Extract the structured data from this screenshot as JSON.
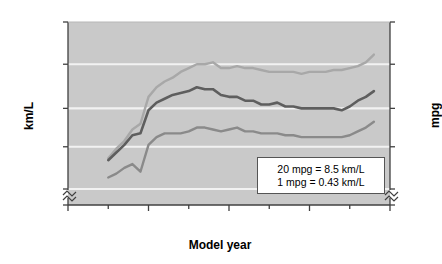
{
  "chart_data": {
    "type": "line",
    "title": "",
    "xlabel": "Model year",
    "ylabel": "km/L",
    "ylabel_right": "mpg",
    "xlim": [
      1970,
      2010
    ],
    "ylim": [
      0,
      13.0
    ],
    "ylim_right": [
      0,
      30
    ],
    "grid": true,
    "grid_orientation": "horizontal",
    "legend_position": "inline-annotations",
    "axis_break_left": true,
    "axis_break_right": true,
    "axis_break_bottom": true,
    "y_ticks_left": [
      "0",
      "4.3",
      "6.5",
      "8.5",
      "10.8",
      "13.0"
    ],
    "y_tick_values_left": [
      0,
      4.3,
      6.5,
      8.5,
      10.8,
      13.0
    ],
    "y_ticks_right": [
      "0",
      "10",
      "15",
      "20",
      "25",
      "30"
    ],
    "y_tick_values_right": [
      0,
      10,
      15,
      20,
      25,
      30
    ],
    "x_ticks": [
      "1970",
      "1980",
      "1990",
      "2000",
      "2010"
    ],
    "x_tick_values": [
      1970,
      1980,
      1990,
      2000,
      2010
    ],
    "x_minor_ticks": [
      1975,
      1985,
      1995,
      2005
    ],
    "x": [
      1975,
      1976,
      1977,
      1978,
      1979,
      1980,
      1981,
      1982,
      1983,
      1984,
      1985,
      1986,
      1987,
      1988,
      1989,
      1990,
      1991,
      1992,
      1993,
      1994,
      1995,
      1996,
      1997,
      1998,
      1999,
      2000,
      2001,
      2002,
      2003,
      2004,
      2005,
      2006,
      2007,
      2008
    ],
    "series": [
      {
        "name": "Cars",
        "color": "#a8a8a8",
        "values": [
          5.9,
          6.4,
          6.8,
          7.4,
          7.7,
          9.1,
          9.6,
          9.9,
          10.1,
          10.4,
          10.6,
          10.8,
          10.8,
          10.9,
          10.6,
          10.6,
          10.7,
          10.6,
          10.6,
          10.5,
          10.4,
          10.4,
          10.4,
          10.4,
          10.3,
          10.4,
          10.4,
          10.4,
          10.5,
          10.5,
          10.6,
          10.7,
          10.9,
          11.3
        ],
        "units": "km/L"
      },
      {
        "name": "Both",
        "color": "#5e5e5e",
        "values": [
          5.8,
          6.2,
          6.6,
          7.1,
          7.2,
          8.4,
          8.8,
          9.0,
          9.2,
          9.3,
          9.4,
          9.6,
          9.5,
          9.5,
          9.2,
          9.1,
          9.1,
          8.9,
          8.9,
          8.7,
          8.7,
          8.8,
          8.6,
          8.6,
          8.5,
          8.5,
          8.5,
          8.5,
          8.5,
          8.4,
          8.6,
          8.9,
          9.1,
          9.4
        ],
        "units": "km/L"
      },
      {
        "name": "Light trucks",
        "color": "#8a8a8a",
        "values": [
          4.9,
          5.1,
          5.4,
          5.6,
          5.2,
          6.6,
          7.0,
          7.2,
          7.2,
          7.2,
          7.3,
          7.5,
          7.5,
          7.4,
          7.3,
          7.4,
          7.5,
          7.3,
          7.3,
          7.2,
          7.2,
          7.2,
          7.1,
          7.1,
          7.0,
          7.0,
          7.0,
          7.0,
          7.0,
          7.0,
          7.1,
          7.3,
          7.5,
          7.8
        ],
        "units": "km/L"
      }
    ],
    "annotations": [
      {
        "name": "cars-label",
        "text": "Cars",
        "x": 1986,
        "y": 11.4
      },
      {
        "name": "both-label",
        "text": "Both",
        "x": 1999,
        "y": 9.3
      },
      {
        "name": "light-trucks-label",
        "text": "Light trucks",
        "x": 1988,
        "y": 6.6
      }
    ],
    "note_box": {
      "lines": [
        "20 mpg = 8.5 km/L",
        "1 mpg = 0.43 km/L"
      ]
    }
  },
  "colors": {
    "plot_background": "#c9c9c9",
    "page_background": "#ffffff",
    "gridline": "#f2f2f2",
    "axis": "#404040",
    "text": "#000000",
    "cars": "#a8a8a8",
    "both": "#5e5e5e",
    "light_trucks": "#8a8a8a"
  }
}
